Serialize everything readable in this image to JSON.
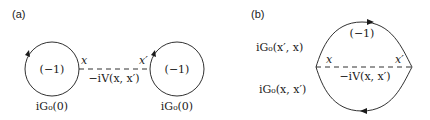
{
  "panel_a": {
    "label": "(a)",
    "left_loop": {
      "factor": "(−1)",
      "propagator": "iG₀(0)"
    },
    "right_loop": {
      "factor": "(−1)",
      "propagator": "iG₀(0)"
    },
    "vertex_left": "x",
    "vertex_right": "x′",
    "interaction": "−iV(x, x′)"
  },
  "panel_b": {
    "label": "(b)",
    "factor": "(−1)",
    "upper_propagator": "iG₀(x′, x)",
    "lower_propagator": "iG₀(x, x′)",
    "vertex_left": "x",
    "vertex_right": "x′",
    "interaction": "−iV(x, x′)"
  },
  "colors": {
    "line": "#1a1a1a",
    "background": "#ffffff"
  }
}
